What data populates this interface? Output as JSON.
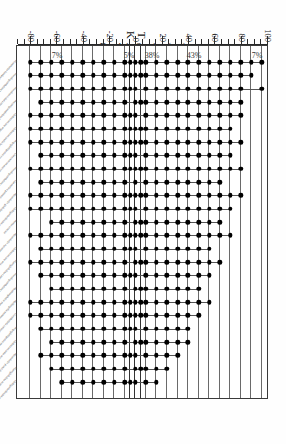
{
  "figure": {
    "panel_letter": "A.",
    "title": "Investigator A (Canudo)",
    "axis_label": "Depth in Section (cm)"
  },
  "boundary_markers": [
    {
      "label": "T",
      "depth": 4
    },
    {
      "label": "K",
      "depth": -4
    }
  ],
  "annotations": [
    {
      "label": "7%",
      "depth": 92
    },
    {
      "label": "43%",
      "depth": 44
    },
    {
      "label": "38%",
      "depth": 12
    },
    {
      "label": "5%",
      "depth": -6
    },
    {
      "label": "7%",
      "depth": -60
    }
  ],
  "chart_data": {
    "type": "scatter",
    "title": "Investigator A (Canudo)",
    "xlabel": "",
    "ylabel": "Depth in Section (cm)",
    "ylim": [
      -90,
      100
    ],
    "yticks": [
      100,
      80,
      60,
      40,
      20,
      0,
      -20,
      -40,
      -60,
      -80
    ],
    "ytick_labels": [
      "100",
      "80",
      "60",
      "40",
      "20",
      "0",
      "-20",
      "-40",
      "-60",
      "-80"
    ],
    "grid": false,
    "legend": "none",
    "horizon_levels": [
      96,
      88,
      80,
      72,
      64,
      56,
      48,
      40,
      32,
      24,
      16,
      8,
      4,
      0,
      -4,
      -8,
      -16,
      -24,
      -32,
      -40,
      -48,
      -56,
      -64,
      -72,
      -80
    ],
    "categories": [
      "Plummerita hantkeninoides",
      "Pseudoguembelina hariaensis",
      "Pseudotextularia elegans",
      "Racemiguembelina fructicosa",
      "Globotruncana aegyptiaca",
      "Globotruncanella havanensis",
      "Rugoglobigerina rugosa",
      "Contusotruncana contusa",
      "Pseudoguembelina costulata",
      "Gansserina gansseri",
      "Heterohelix globulosa",
      "Globigerinelloides subcarinatus",
      "Rosita contusa",
      "Heterohelix navarroensis",
      "Globotruncana arca",
      "Planoglobulina carseyae",
      "Pseudoguembelina palpebra",
      "Abathomphalus mayaroensis",
      "Hedbergella monmouthensis",
      "Guembelitria cretacea",
      "Rugoglobigerina macrocephala",
      "Globotruncanita stuarti",
      "Heterohelix punctulata",
      "Planoglobulina acervulinoides",
      "Globigerinelloides prairiehillensis"
    ],
    "series": [
      {
        "name": "Plummerita hantkeninoides",
        "top": 96,
        "bottom": -80,
        "occurrences": [
          96,
          88,
          80,
          72,
          64,
          56,
          48,
          40,
          32,
          24,
          16,
          8,
          4,
          0,
          -4,
          -8,
          -16,
          -24,
          -32,
          -40,
          -48,
          -56,
          -64,
          -72,
          -80
        ]
      },
      {
        "name": "Pseudoguembelina hariaensis",
        "top": 88,
        "bottom": -80,
        "occurrences": [
          88,
          80,
          72,
          64,
          56,
          48,
          40,
          32,
          24,
          16,
          8,
          4,
          0,
          -4,
          -8,
          -16,
          -24,
          -32,
          -40,
          -48,
          -56,
          -64,
          -72,
          -80
        ]
      },
      {
        "name": "Pseudotextularia elegans",
        "top": 96,
        "bottom": -80,
        "occurrences": [
          96,
          80,
          72,
          64,
          56,
          48,
          40,
          32,
          24,
          16,
          8,
          0,
          -4,
          -8,
          -16,
          -24,
          -32,
          -40,
          -48,
          -56,
          -64,
          -72,
          -80
        ]
      },
      {
        "name": "Racemiguembelina fructicosa",
        "top": 80,
        "bottom": -72,
        "occurrences": [
          80,
          72,
          64,
          56,
          48,
          40,
          32,
          24,
          16,
          8,
          4,
          0,
          -8,
          -16,
          -24,
          -32,
          -40,
          -48,
          -56,
          -64,
          -72
        ]
      },
      {
        "name": "Globotruncana aegyptiaca",
        "top": 80,
        "bottom": -80,
        "occurrences": [
          80,
          72,
          64,
          56,
          48,
          40,
          32,
          24,
          16,
          8,
          0,
          -4,
          -8,
          -16,
          -24,
          -32,
          -40,
          -48,
          -56,
          -64,
          -72,
          -80
        ]
      },
      {
        "name": "Globotruncanella havanensis",
        "top": 72,
        "bottom": -80,
        "occurrences": [
          72,
          64,
          56,
          48,
          40,
          32,
          24,
          16,
          8,
          4,
          0,
          -4,
          -8,
          -16,
          -24,
          -32,
          -40,
          -48,
          -56,
          -64,
          -72,
          -80
        ]
      },
      {
        "name": "Rugoglobigerina rugosa",
        "top": 80,
        "bottom": -80,
        "occurrences": [
          80,
          72,
          64,
          56,
          48,
          40,
          32,
          24,
          16,
          8,
          4,
          0,
          -4,
          -8,
          -16,
          -24,
          -32,
          -40,
          -48,
          -56,
          -64,
          -72,
          -80
        ]
      },
      {
        "name": "Contusotruncana contusa",
        "top": 72,
        "bottom": -72,
        "occurrences": [
          72,
          64,
          56,
          48,
          40,
          32,
          24,
          16,
          8,
          0,
          -4,
          -8,
          -16,
          -24,
          -32,
          -40,
          -48,
          -56,
          -64,
          -72
        ]
      },
      {
        "name": "Pseudoguembelina costulata",
        "top": 80,
        "bottom": -80,
        "occurrences": [
          80,
          72,
          64,
          56,
          48,
          40,
          32,
          24,
          16,
          8,
          4,
          0,
          -4,
          -8,
          -16,
          -24,
          -32,
          -40,
          -48,
          -56,
          -64,
          -72,
          -80
        ]
      },
      {
        "name": "Gansserina gansseri",
        "top": 64,
        "bottom": -72,
        "occurrences": [
          64,
          56,
          48,
          40,
          32,
          24,
          16,
          8,
          0,
          -8,
          -16,
          -24,
          -32,
          -40,
          -48,
          -56,
          -64,
          -72
        ]
      },
      {
        "name": "Heterohelix globulosa",
        "top": 80,
        "bottom": -80,
        "occurrences": [
          80,
          72,
          64,
          56,
          48,
          40,
          32,
          24,
          16,
          8,
          4,
          0,
          -4,
          -8,
          -16,
          -24,
          -32,
          -40,
          -48,
          -56,
          -64,
          -72,
          -80
        ]
      },
      {
        "name": "Globigerinelloides subcarinatus",
        "top": 72,
        "bottom": -80,
        "occurrences": [
          72,
          64,
          56,
          48,
          40,
          32,
          24,
          16,
          8,
          0,
          -4,
          -8,
          -16,
          -24,
          -32,
          -40,
          -48,
          -56,
          -64,
          -72,
          -80
        ]
      },
      {
        "name": "Rosita contusa",
        "top": 64,
        "bottom": -64,
        "occurrences": [
          64,
          56,
          48,
          40,
          32,
          24,
          16,
          8,
          4,
          0,
          -8,
          -16,
          -24,
          -32,
          -40,
          -48,
          -56,
          -64
        ]
      },
      {
        "name": "Heterohelix navarroensis",
        "top": 72,
        "bottom": -80,
        "occurrences": [
          72,
          64,
          56,
          48,
          40,
          32,
          24,
          16,
          8,
          4,
          0,
          -4,
          -8,
          -16,
          -24,
          -32,
          -40,
          -48,
          -56,
          -64,
          -72,
          -80
        ]
      },
      {
        "name": "Globotruncana arca",
        "top": 56,
        "bottom": -72,
        "occurrences": [
          56,
          48,
          40,
          32,
          24,
          16,
          8,
          0,
          -4,
          -8,
          -16,
          -24,
          -32,
          -40,
          -48,
          -56,
          -64,
          -72
        ]
      },
      {
        "name": "Planoglobulina carseyae",
        "top": 64,
        "bottom": -80,
        "occurrences": [
          64,
          56,
          48,
          40,
          32,
          24,
          16,
          8,
          4,
          0,
          -8,
          -16,
          -24,
          -32,
          -40,
          -48,
          -56,
          -64,
          -72,
          -80
        ]
      },
      {
        "name": "Pseudoguembelina palpebra",
        "top": 56,
        "bottom": -72,
        "occurrences": [
          56,
          48,
          40,
          32,
          24,
          16,
          8,
          0,
          -4,
          -8,
          -16,
          -24,
          -32,
          -40,
          -48,
          -56,
          -64,
          -72
        ]
      },
      {
        "name": "Abathomphalus mayaroensis",
        "top": 48,
        "bottom": -64,
        "occurrences": [
          48,
          40,
          32,
          24,
          16,
          8,
          4,
          0,
          -8,
          -16,
          -24,
          -32,
          -40,
          -48,
          -56,
          -64
        ]
      },
      {
        "name": "Hedbergella monmouthensis",
        "top": 56,
        "bottom": -80,
        "occurrences": [
          56,
          48,
          40,
          32,
          24,
          16,
          8,
          4,
          0,
          -4,
          -8,
          -16,
          -24,
          -32,
          -40,
          -48,
          -56,
          -64,
          -72,
          -80
        ]
      },
      {
        "name": "Guembelitria cretacea",
        "top": 48,
        "bottom": -80,
        "occurrences": [
          48,
          40,
          32,
          24,
          16,
          8,
          4,
          0,
          -4,
          -8,
          -16,
          -24,
          -32,
          -40,
          -48,
          -56,
          -64,
          -72,
          -80
        ]
      },
      {
        "name": "Rugoglobigerina macrocephala",
        "top": 40,
        "bottom": -72,
        "occurrences": [
          40,
          32,
          24,
          16,
          8,
          0,
          -4,
          -8,
          -16,
          -24,
          -32,
          -40,
          -48,
          -56,
          -64,
          -72
        ]
      },
      {
        "name": "Globotruncanita stuarti",
        "top": 40,
        "bottom": -64,
        "occurrences": [
          40,
          32,
          24,
          16,
          8,
          4,
          0,
          -8,
          -16,
          -24,
          -32,
          -40,
          -48,
          -56,
          -64
        ]
      },
      {
        "name": "Heterohelix punctulata",
        "top": 32,
        "bottom": -72,
        "occurrences": [
          32,
          24,
          16,
          8,
          0,
          -4,
          -8,
          -16,
          -24,
          -32,
          -40,
          -48,
          -56,
          -64,
          -72
        ]
      },
      {
        "name": "Planoglobulina acervulinoides",
        "top": 24,
        "bottom": -64,
        "occurrences": [
          24,
          16,
          8,
          4,
          0,
          -8,
          -16,
          -24,
          -32,
          -40,
          -48,
          -56,
          -64
        ]
      },
      {
        "name": "Globigerinelloides prairiehillensis",
        "top": 16,
        "bottom": -56,
        "occurrences": [
          16,
          8,
          0,
          -4,
          -8,
          -16,
          -24,
          -32,
          -40,
          -48,
          -56
        ]
      }
    ]
  }
}
